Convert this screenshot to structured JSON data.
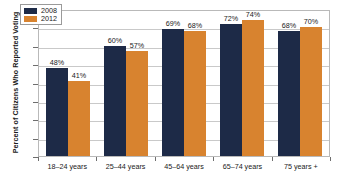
{
  "chart_data": {
    "type": "bar",
    "title": "",
    "xlabel": "",
    "ylabel": "Percent of Citizens Who Reported Voting",
    "ylim": [
      0,
      80
    ],
    "yticks": [
      0,
      10,
      20,
      30,
      40,
      50,
      60,
      70,
      80
    ],
    "ytick_labels": [
      "0",
      "10",
      "20",
      "30",
      "40",
      "50",
      "60",
      "70",
      "80"
    ],
    "grid": true,
    "legend_position": "top-left-inside",
    "categories": [
      "18–24 years",
      "25–44 years",
      "45–64 years",
      "65–74 years",
      "75 years +"
    ],
    "series": [
      {
        "name": "2008",
        "color": "#1d2a47",
        "values": [
          48,
          60,
          69,
          72,
          68
        ],
        "value_labels": [
          "48%",
          "60%",
          "69%",
          "72%",
          "68%"
        ]
      },
      {
        "name": "2012",
        "color": "#d8832f",
        "values": [
          41,
          57,
          68,
          74,
          70
        ],
        "value_labels": [
          "41%",
          "57%",
          "68%",
          "74%",
          "70%"
        ]
      }
    ],
    "colors": {
      "series_2008": "#1d2a47",
      "series_2012": "#d8832f",
      "gridline": "#c9c9c9",
      "axis": "#6e6e6e",
      "plot_border": "#b9b9b9",
      "text": "#1a1a1a",
      "background": "#ffffff"
    }
  }
}
